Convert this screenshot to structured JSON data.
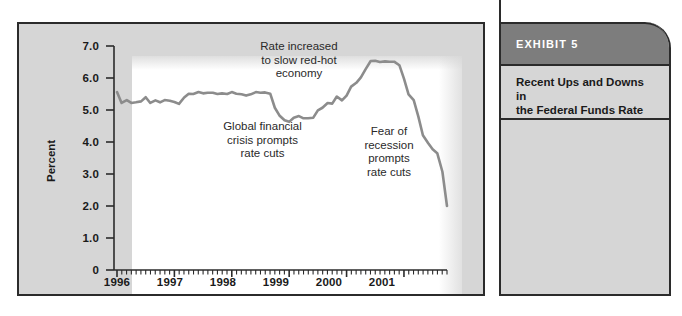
{
  "chart_data": {
    "type": "line",
    "title": "",
    "xlabel": "",
    "ylabel": "Percent",
    "ylim": [
      0,
      7.0
    ],
    "xlim": [
      1996.0,
      2001.75
    ],
    "grid": false,
    "legend": "none",
    "line_color": "#8c8c8c",
    "y_ticks": [
      "0",
      "1.0",
      "2.0",
      "3.0",
      "4.0",
      "5.0",
      "6.0",
      "7.0"
    ],
    "y_tick_values": [
      0,
      1.0,
      2.0,
      3.0,
      4.0,
      5.0,
      6.0,
      7.0
    ],
    "x_ticks": [
      "1996",
      "1997",
      "1998",
      "1999",
      "2000",
      "2001"
    ],
    "x_tick_values": [
      1996,
      1997,
      1998,
      1999,
      2000,
      2001
    ],
    "minor_x_ticks_per_year": 12,
    "series": [
      {
        "name": "Federal Funds Rate",
        "x": [
          1996.0,
          1996.08,
          1996.17,
          1996.25,
          1996.33,
          1996.42,
          1996.5,
          1996.58,
          1996.67,
          1996.75,
          1996.83,
          1996.92,
          1997.0,
          1997.08,
          1997.17,
          1997.25,
          1997.33,
          1997.42,
          1997.5,
          1997.58,
          1997.67,
          1997.75,
          1997.83,
          1997.92,
          1998.0,
          1998.08,
          1998.17,
          1998.25,
          1998.33,
          1998.42,
          1998.5,
          1998.58,
          1998.67,
          1998.75,
          1998.83,
          1998.92,
          1999.0,
          1999.08,
          1999.17,
          1999.25,
          1999.33,
          1999.42,
          1999.5,
          1999.58,
          1999.67,
          1999.75,
          1999.83,
          1999.92,
          2000.0,
          2000.08,
          2000.17,
          2000.25,
          2000.33,
          2000.42,
          2000.5,
          2000.58,
          2000.67,
          2000.75,
          2000.83,
          2000.92,
          2001.0,
          2001.08,
          2001.17,
          2001.25,
          2001.33,
          2001.42,
          2001.5,
          2001.58,
          2001.67,
          2001.75
        ],
        "y": [
          5.56,
          5.22,
          5.31,
          5.22,
          5.24,
          5.27,
          5.4,
          5.22,
          5.3,
          5.24,
          5.31,
          5.29,
          5.25,
          5.19,
          5.39,
          5.51,
          5.5,
          5.56,
          5.52,
          5.54,
          5.54,
          5.5,
          5.52,
          5.5,
          5.56,
          5.51,
          5.49,
          5.45,
          5.49,
          5.56,
          5.54,
          5.55,
          5.51,
          5.07,
          4.83,
          4.68,
          4.63,
          4.76,
          4.81,
          4.74,
          4.74,
          4.76,
          4.99,
          5.07,
          5.22,
          5.2,
          5.42,
          5.3,
          5.45,
          5.73,
          5.85,
          6.02,
          6.27,
          6.53,
          6.54,
          6.5,
          6.52,
          6.51,
          6.51,
          6.4,
          5.98,
          5.49,
          5.31,
          4.8,
          4.21,
          3.97,
          3.77,
          3.65,
          3.07,
          2.0
        ],
        "peak_value": 6.54,
        "end_value": 2.0,
        "start_value": 5.56,
        "trough_value": 4.63
      }
    ],
    "annotations": [
      {
        "id": "rate-increased",
        "text": "Rate increased\nto slow red-hot\neconomy",
        "x": 1999.55,
        "y": 6.6
      },
      {
        "id": "global-financial-crisis",
        "text": "Global financial\ncrisis prompts\nrate cuts",
        "x": 1998.6,
        "y": 3.9
      },
      {
        "id": "fear-of-recession",
        "text": "Fear of\nrecession\nprompts\nrate cuts",
        "x": 2001.0,
        "y": 3.6
      }
    ]
  },
  "exhibit": {
    "header_label": "EXHIBIT 5",
    "caption": "Recent Ups and Downs in\nthe Federal Funds Rate"
  },
  "colors": {
    "panel_background": "#d6d6d6",
    "plot_background": "#ffffff",
    "border": "#2b2b2b",
    "line": "#8c8c8c",
    "exhibit_header": "#7d7d7d",
    "exhibit_header_text": "#ffffff",
    "text": "#1a1a1a"
  }
}
